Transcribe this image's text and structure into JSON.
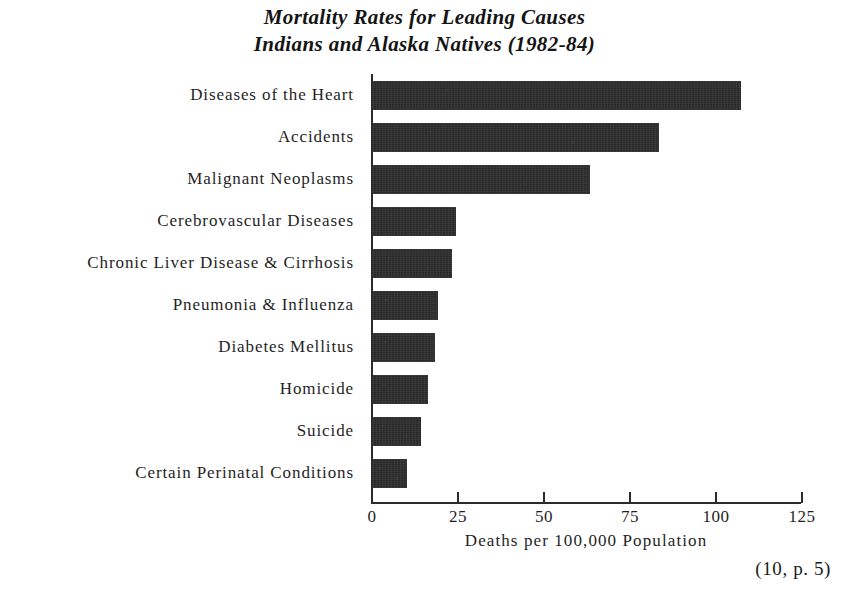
{
  "chart_data": {
    "type": "bar",
    "orientation": "horizontal",
    "title": "Mortality Rates for Leading Causes",
    "subtitle": "Indians and Alaska Natives (1982-84)",
    "title_lines": [
      "Mortality Rates for Leading Causes",
      "Indians and Alaska Natives (1982-84)"
    ],
    "xlabel": "Deaths per 100,000 Population",
    "ylabel": "",
    "categories": [
      "Diseases of the Heart",
      "Accidents",
      "Malignant Neoplasms",
      "Cerebrovascular Diseases",
      "Chronic Liver Disease & Cirrhosis",
      "Pneumonia & Influenza",
      "Diabetes Mellitus",
      "Homicide",
      "Suicide",
      "Certain Perinatal Conditions"
    ],
    "values": [
      107,
      83,
      63,
      24,
      23,
      19,
      18,
      16,
      14,
      10
    ],
    "xlim": [
      0,
      125
    ],
    "xticks": [
      0,
      25,
      50,
      75,
      100,
      125
    ],
    "xtick_labels": [
      "0",
      "25",
      "50",
      "75",
      "100",
      "125"
    ],
    "grid": false,
    "legend": false,
    "bar_color": "#282828",
    "axis_color": "#2b2b2b",
    "background_color": "#ffffff"
  },
  "footer": {
    "citation": "(10, p. 5)"
  }
}
